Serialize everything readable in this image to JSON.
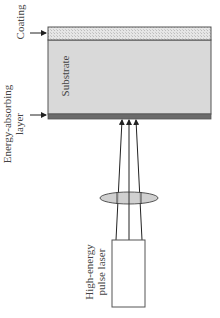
{
  "diagram": {
    "title": "",
    "labels": {
      "coating": "Coating",
      "substrate": "Substrate",
      "energy_layer_line1": "Energy-absorbing",
      "energy_layer_line2": "layer",
      "laser_line1": "High-energy",
      "laser_line2": "pulse laser"
    },
    "colors": {
      "coating_fill": "#e2e2e2",
      "substrate_fill": "#d9d9d9",
      "absorbing_layer_fill": "#6b6b6b",
      "outline": "#555555",
      "lens_fill": "#c8c8c8",
      "beam": "#222222",
      "text": "#444444"
    },
    "components": [
      {
        "id": "coating",
        "type": "layer"
      },
      {
        "id": "substrate",
        "type": "layer"
      },
      {
        "id": "energy-absorbing-layer",
        "type": "layer"
      },
      {
        "id": "lens",
        "type": "optic"
      },
      {
        "id": "high-energy-pulse-laser",
        "type": "source"
      }
    ],
    "beams": 3
  }
}
